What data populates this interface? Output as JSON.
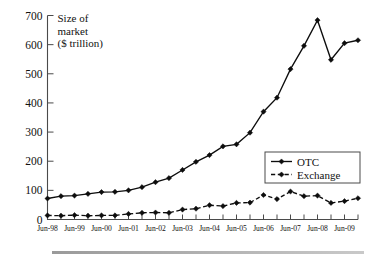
{
  "figure": {
    "axis_title_lines": [
      "Size of",
      "market",
      "($ trillion)"
    ],
    "y_tick_labels": [
      "0",
      "100",
      "200",
      "300",
      "400",
      "500",
      "600",
      "700"
    ],
    "x_tick_labels": [
      "Jun-98",
      "Jun-99",
      "Jun-00",
      "Jun-01",
      "Jun-02",
      "Jun-03",
      "Jun-04",
      "Jun-05",
      "Jun-06",
      "Jun-07",
      "Jun-08",
      "Jun-09"
    ],
    "legend": {
      "items": [
        {
          "label": "OTC",
          "style": "solid",
          "marker": "diamond",
          "color": "#0d0d0d"
        },
        {
          "label": "Exchange",
          "style": "dashed",
          "marker": "diamond",
          "color": "#0d0d0d"
        }
      ]
    }
  },
  "chart_data": {
    "type": "line",
    "title": "",
    "subtitle": "",
    "xlabel": "",
    "ylabel": "Size of market ($ trillion)",
    "ylim": [
      0,
      700
    ],
    "ytick_step": 100,
    "grid": false,
    "legend_position": "inside-right",
    "x": [
      "Jun-98",
      "Dec-98",
      "Jun-99",
      "Dec-99",
      "Jun-00",
      "Dec-00",
      "Jun-01",
      "Dec-01",
      "Jun-02",
      "Dec-02",
      "Jun-03",
      "Dec-03",
      "Jun-04",
      "Dec-04",
      "Jun-05",
      "Dec-05",
      "Jun-06",
      "Dec-06",
      "Jun-07",
      "Dec-07",
      "Jun-08",
      "Dec-08",
      "Jun-09",
      "Dec-09"
    ],
    "x_tick_labels": [
      "Jun-98",
      "Jun-99",
      "Jun-00",
      "Jun-01",
      "Jun-02",
      "Jun-03",
      "Jun-04",
      "Jun-05",
      "Jun-06",
      "Jun-07",
      "Jun-08",
      "Jun-09"
    ],
    "series": [
      {
        "name": "OTC",
        "style": "solid",
        "marker": "diamond",
        "values": [
          72,
          80,
          82,
          88,
          94,
          95,
          100,
          111,
          128,
          142,
          170,
          198,
          221,
          251,
          258,
          298,
          370,
          418,
          516,
          596,
          684,
          548,
          605,
          615
        ]
      },
      {
        "name": "Exchange",
        "style": "dashed",
        "marker": "diamond",
        "values": [
          14,
          13,
          15,
          13,
          14,
          14,
          19,
          23,
          24,
          23,
          34,
          37,
          49,
          46,
          57,
          58,
          84,
          70,
          96,
          80,
          82,
          57,
          63,
          73
        ]
      }
    ]
  }
}
